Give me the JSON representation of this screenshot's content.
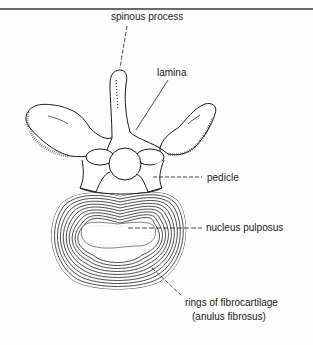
{
  "figure": {
    "labels": {
      "spinous_process": "spinous process",
      "lamina": "lamina",
      "pedicle": "pedicle",
      "nucleus_pulposus": "nucleus pulposus",
      "rings_line1": "rings of fibrocartilage",
      "rings_line2": "(anulus fibrosus)"
    },
    "colors": {
      "ink": "#1a1a1a",
      "rule": "#6a6a6a",
      "background": "#fdfdfd"
    }
  }
}
